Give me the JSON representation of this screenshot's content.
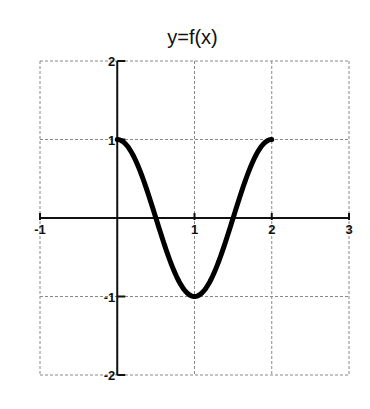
{
  "chart_data": {
    "type": "line",
    "title": "y=f(x)",
    "xlabel": "",
    "ylabel": "",
    "xlim": [
      -1,
      3
    ],
    "ylim": [
      -2,
      2
    ],
    "x_ticks": [
      "-1",
      "1",
      "2",
      "3"
    ],
    "y_ticks": [
      "2",
      "1",
      "-1",
      "-2"
    ],
    "grid": true,
    "legend": null,
    "series": [
      {
        "name": "f(x)",
        "description": "cosine-like curve from (0,1) down to (1,-1) and back up to (2,1)",
        "x": [
          0,
          0.25,
          0.5,
          0.75,
          1,
          1.25,
          1.5,
          1.75,
          2
        ],
        "y": [
          1,
          0.71,
          0,
          -0.71,
          -1,
          -0.71,
          0,
          0.71,
          1
        ]
      }
    ]
  }
}
